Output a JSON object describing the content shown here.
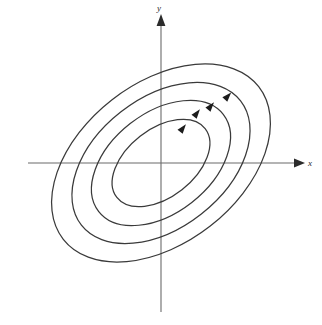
{
  "figure": {
    "title": "",
    "caption": "",
    "background_color": "#ffffff",
    "axis_color": "#6b6b6b",
    "curve_color": "#3a3a3a",
    "arrow_color": "#1c1c1c"
  },
  "axes": {
    "x_label": "x",
    "y_label": "y",
    "origin_px": {
      "x": 161,
      "y": 163
    },
    "x_axis": {
      "x1": 28,
      "x2": 300,
      "y": 163,
      "arrow": "right"
    },
    "y_axis": {
      "y1": 14,
      "y2": 312,
      "x": 161,
      "arrow": "up"
    }
  },
  "chart_data": {
    "type": "scatter",
    "subtype": "phase-portrait",
    "title": "",
    "xlabel": "x",
    "ylabel": "y",
    "grid": false,
    "legend": null,
    "xlim": [
      -133,
      139
    ],
    "ylim": [
      -149,
      149
    ],
    "equilibrium": {
      "x": 0,
      "y": 0,
      "classification": "center",
      "stability": "stable (neutrally)"
    },
    "rotation_deg": -38,
    "orbits": [
      {
        "name": "orbit-1",
        "semi_major": 56,
        "semi_minor": 34,
        "rotation_deg": -38
      },
      {
        "name": "orbit-2",
        "semi_major": 79,
        "semi_minor": 50,
        "rotation_deg": -38
      },
      {
        "name": "orbit-3",
        "semi_major": 101,
        "semi_minor": 65,
        "rotation_deg": -38
      },
      {
        "name": "orbit-4",
        "semi_major": 124,
        "semi_minor": 80,
        "rotation_deg": -38
      }
    ],
    "flow_arrows": [
      {
        "name": "flow-arrow-1",
        "x": 183,
        "y": 128,
        "angle_deg": -52,
        "orbit": "orbit-1"
      },
      {
        "name": "flow-arrow-2",
        "x": 197,
        "y": 113,
        "angle_deg": -52,
        "orbit": "orbit-2"
      },
      {
        "name": "flow-arrow-3",
        "x": 211,
        "y": 106,
        "angle_deg": -50,
        "orbit": "orbit-3"
      },
      {
        "name": "flow-arrow-4",
        "x": 228,
        "y": 96,
        "angle_deg": -48,
        "orbit": "orbit-4"
      }
    ],
    "flow_direction": "counterclockwise"
  }
}
